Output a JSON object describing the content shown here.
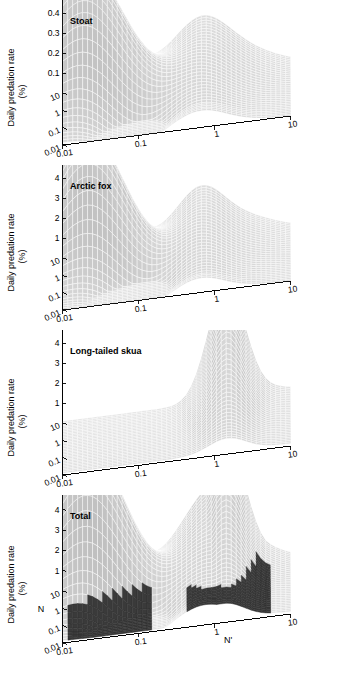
{
  "figure": {
    "ylabel": "Daily predation rate",
    "ylabel_units": "(%)",
    "xlabel_n": "N",
    "xlabel_nprime": "N'",
    "colors": {
      "surface_light": "#d9d9d9",
      "surface_mid": "#c4c4c4",
      "surface_dark": "#3a3a3a",
      "mesh_line": "#ffffff",
      "axis": "#000000",
      "background": "#ffffff"
    }
  },
  "chart_data": [
    {
      "type": "surface",
      "title": "Stoat",
      "xlabel": "N",
      "ylabel": "N'",
      "zlabel": "Daily predation rate (%)",
      "x_ticks": [
        "10",
        "1",
        "0.1",
        "0.01"
      ],
      "y_ticks": [
        "0.01",
        "0.1",
        "1",
        "10"
      ],
      "z_ticks": [
        "0.1",
        "0.2",
        "0.3",
        "0.4",
        "0.5",
        "0.6"
      ],
      "zlim": [
        0,
        0.6
      ],
      "xlim": [
        0.01,
        10
      ],
      "ylim": [
        0.01,
        10
      ],
      "log_axes": [
        "x",
        "y"
      ],
      "grid": true,
      "peak_value": 0.6,
      "peak_at": {
        "N": 0.3,
        "Nprime": 0.02
      },
      "secondary_ridge_value": 0.25,
      "secondary_ridge_at": {
        "N": 10,
        "Nprime": 1.0
      },
      "trough_value": 0.03,
      "trough_at": {
        "N": 0.04,
        "Nprime": 0.15
      },
      "description": "Ridge rising to 0.6 at low N' and intermediate N, shallow saddle then secondary shelf near N'=1"
    },
    {
      "type": "surface",
      "title": "Arctic fox",
      "xlabel": "N",
      "ylabel": "N'",
      "zlabel": "Daily predation rate (%)",
      "x_ticks": [
        "10",
        "1",
        "0.1",
        "0.01"
      ],
      "y_ticks": [
        "0.01",
        "0.1",
        "1",
        "10"
      ],
      "z_ticks": [
        "1",
        "2",
        "3",
        "4",
        "5",
        "6"
      ],
      "zlim": [
        0,
        6
      ],
      "xlim": [
        0.01,
        10
      ],
      "ylim": [
        0.01,
        10
      ],
      "log_axes": [
        "x",
        "y"
      ],
      "grid": true,
      "peak_value": 5.4,
      "peak_at": {
        "N": 0.3,
        "Nprime": 0.02
      },
      "secondary_ridge_value": 2.5,
      "secondary_ridge_at": {
        "N": 10,
        "Nprime": 1.0
      },
      "trough_value": 0.2,
      "trough_at": {
        "N": 0.05,
        "Nprime": 0.2
      },
      "description": "Single dominant peak near 5.4 at low N' with broad decay and secondary shelf near N'=1"
    },
    {
      "type": "surface",
      "title": "Long-tailed skua",
      "xlabel": "N",
      "ylabel": "N'",
      "zlabel": "Daily predation rate (%)",
      "x_ticks": [
        "10",
        "1",
        "0.1",
        "0.01"
      ],
      "y_ticks": [
        "0.01",
        "0.1",
        "1",
        "10"
      ],
      "z_ticks": [
        "1",
        "2",
        "3",
        "4",
        "5",
        "6"
      ],
      "zlim": [
        0,
        6
      ],
      "xlim": [
        0.01,
        10
      ],
      "ylim": [
        0.01,
        10
      ],
      "log_axes": [
        "x",
        "y"
      ],
      "grid": true,
      "peak_value": 5.6,
      "peak_at": {
        "N": 0.01,
        "Nprime": 1.5
      },
      "trough_value": 0.05,
      "trough_at": {
        "N": 10,
        "Nprime": 0.01
      },
      "description": "Flat near zero over most of domain, rising to a sharp ridge at N' near 1.5 along the low N edge"
    },
    {
      "type": "surface",
      "title": "Total",
      "xlabel": "N",
      "ylabel": "N'",
      "zlabel": "Daily predation rate (%)",
      "x_ticks": [
        "10",
        "1",
        "0.1",
        "0.01"
      ],
      "y_ticks": [
        "0.01",
        "0.1",
        "1",
        "10"
      ],
      "z_ticks": [
        "1",
        "2",
        "3",
        "4",
        "5",
        "6"
      ],
      "zlim": [
        0,
        6
      ],
      "xlim": [
        0.01,
        10
      ],
      "ylim": [
        0.01,
        10
      ],
      "log_axes": [
        "x",
        "y"
      ],
      "grid": true,
      "peak_value": 5.8,
      "peak_at": {
        "N": 0.3,
        "Nprime": 0.02
      },
      "second_peak_value": 5.6,
      "second_peak_at": {
        "N": 0.01,
        "Nprime": 1.5
      },
      "saddle_value": 2.6,
      "shaded_region_label": "low predation rate region",
      "shaded_threshold": 1.0,
      "description": "Sum of three predator surfaces: twin peaks near 5.8 and 5.6 separated by a saddle, with dark shaded low-rate basins below 1%"
    }
  ]
}
